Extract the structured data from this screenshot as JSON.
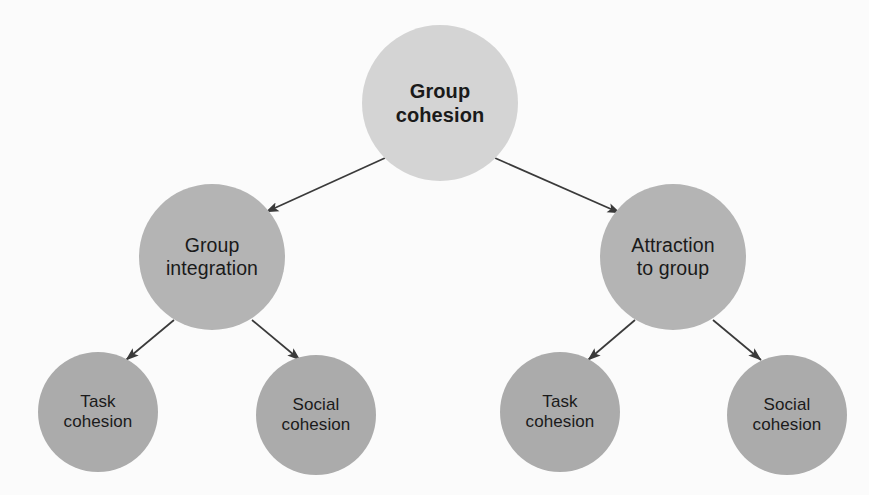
{
  "diagram": {
    "type": "hierarchy-tree",
    "background_color": "#fbfbfb",
    "edge_color": "#3a3a3a",
    "nodes": [
      {
        "id": "group-cohesion",
        "label": "Group\ncohesion",
        "level": "root",
        "cx": 440,
        "cy": 103,
        "r": 78,
        "fill": "#d4d4d4",
        "bold": true
      },
      {
        "id": "group-integration",
        "label": "Group\nintegration",
        "level": "mid",
        "cx": 212,
        "cy": 257,
        "r": 73,
        "fill": "#b4b4b4",
        "bold": false
      },
      {
        "id": "attraction-to-group",
        "label": "Attraction\nto group",
        "level": "mid",
        "cx": 673,
        "cy": 257,
        "r": 73,
        "fill": "#b4b4b4",
        "bold": false
      },
      {
        "id": "integration-task-cohesion",
        "label": "Task\ncohesion",
        "level": "leaf",
        "cx": 98,
        "cy": 412,
        "r": 60,
        "fill": "#ababab",
        "bold": false
      },
      {
        "id": "integration-social-cohesion",
        "label": "Social\ncohesion",
        "level": "leaf",
        "cx": 316,
        "cy": 415,
        "r": 60,
        "fill": "#ababab",
        "bold": false
      },
      {
        "id": "attraction-task-cohesion",
        "label": "Task\ncohesion",
        "level": "leaf",
        "cx": 560,
        "cy": 412,
        "r": 60,
        "fill": "#ababab",
        "bold": false
      },
      {
        "id": "attraction-social-cohesion",
        "label": "Social\ncohesion",
        "level": "leaf",
        "cx": 787,
        "cy": 415,
        "r": 60,
        "fill": "#ababab",
        "bold": false
      }
    ],
    "edges": [
      {
        "id": "edge-cohesion-integration",
        "from": "group-cohesion",
        "to": "group-integration",
        "x1": 385,
        "y1": 158,
        "x2": 266,
        "y2": 212
      },
      {
        "id": "edge-cohesion-attraction",
        "from": "group-cohesion",
        "to": "attraction-to-group",
        "x1": 495,
        "y1": 158,
        "x2": 620,
        "y2": 213
      },
      {
        "id": "edge-integration-task",
        "from": "group-integration",
        "to": "integration-task-cohesion",
        "x1": 174,
        "y1": 320,
        "x2": 126,
        "y2": 360
      },
      {
        "id": "edge-integration-social",
        "from": "group-integration",
        "to": "integration-social-cohesion",
        "x1": 252,
        "y1": 320,
        "x2": 300,
        "y2": 360
      },
      {
        "id": "edge-attraction-task",
        "from": "attraction-to-group",
        "to": "attraction-task-cohesion",
        "x1": 635,
        "y1": 320,
        "x2": 588,
        "y2": 360
      },
      {
        "id": "edge-attraction-social",
        "from": "attraction-to-group",
        "to": "attraction-social-cohesion",
        "x1": 713,
        "y1": 320,
        "x2": 761,
        "y2": 360
      }
    ]
  }
}
